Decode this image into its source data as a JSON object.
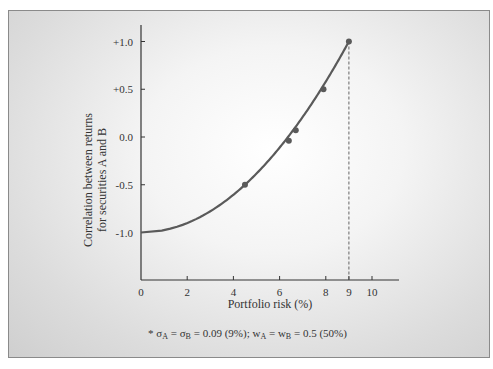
{
  "chart_data": {
    "type": "line",
    "title": "",
    "xlabel": "Portfolio risk (%)",
    "ylabel_line1": "Correlation between returns",
    "ylabel_line2": "for securities A and B",
    "x_ticks": [
      "0",
      "2",
      "4",
      "6",
      "8",
      "9",
      "10"
    ],
    "x_tick_values": [
      0,
      2,
      4,
      6,
      8,
      9,
      10
    ],
    "y_ticks": [
      "+1.0",
      "+0.5",
      "0.0",
      "-0.5",
      "-1.0"
    ],
    "y_tick_values": [
      1.0,
      0.5,
      0.0,
      -0.5,
      -1.0
    ],
    "xlim": [
      0,
      11.5
    ],
    "ylim": [
      -1.5,
      1.15
    ],
    "grid": false,
    "series": [
      {
        "name": "Portfolio risk vs correlation",
        "curve": "sigma = 9 * sqrt((1 + rho) / 2)",
        "x": [
          0,
          2.25,
          4.5,
          5.5,
          6.36,
          7.12,
          7.79,
          8.42,
          9.0
        ],
        "y": [
          -1.0,
          -0.875,
          -0.5,
          -0.25,
          0.0,
          0.25,
          0.5,
          0.75,
          1.0
        ]
      }
    ],
    "markers": [
      {
        "x": 4.5,
        "y": -0.5
      },
      {
        "x": 6.4,
        "y": -0.04
      },
      {
        "x": 6.7,
        "y": 0.07
      },
      {
        "x": 7.9,
        "y": 0.5
      },
      {
        "x": 9.0,
        "y": 1.0
      }
    ],
    "reference_line": {
      "x": 9,
      "style": "dashed",
      "from_y": -1.5,
      "to_y": 1.0
    },
    "annotations": [
      "* σA = σB = 0.09 (9%); wA = wB = 0.5 (50%)"
    ],
    "line_color": "#5a5a5a"
  },
  "footnote": {
    "prefix": "* σ",
    "sub_a": "A",
    "mid": " = σ",
    "sub_b": "B",
    "text1": " = 0.09 (9%); w",
    "sub_wa": "A",
    "text2": " = w",
    "sub_wb": "B",
    "text3": " = 0.5 (50%)"
  }
}
